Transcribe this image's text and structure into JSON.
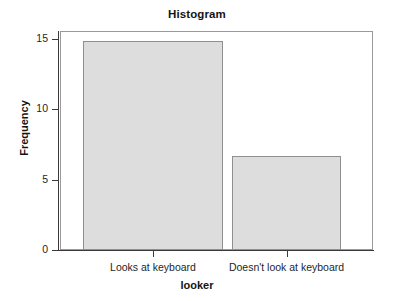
{
  "chart_data": {
    "type": "bar",
    "title": "Histogram",
    "xlabel": "looker",
    "ylabel": "Frequency",
    "categories": [
      "Looks at keyboard",
      "Doesn't look at keyboard"
    ],
    "values": [
      14.85,
      6.7
    ],
    "ylim": [
      0,
      15.5
    ],
    "yticks": [
      0,
      5,
      10,
      15
    ],
    "ytick_labels": [
      "0",
      "5",
      "10",
      "15"
    ],
    "grid": false,
    "legend": null,
    "bar_fill_color": "#dddddd",
    "bar_edge_color": "#8f8f8f",
    "axis_color": "#3a3a3a",
    "frame_color": "#9a9a9a",
    "background_color": "#ffffff"
  }
}
